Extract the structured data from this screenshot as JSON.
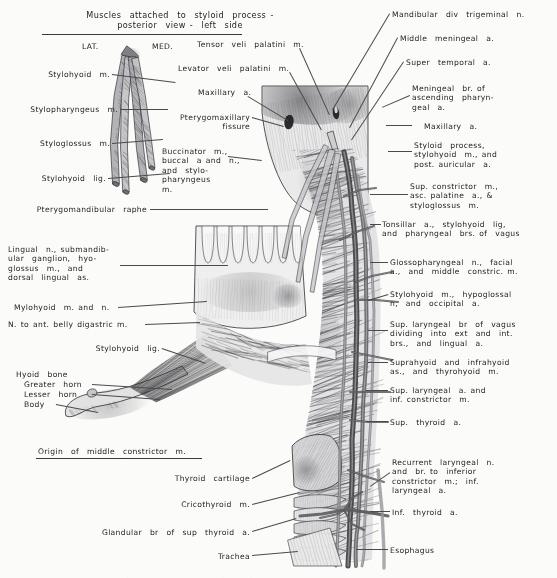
{
  "plate": {
    "title": "Muscles attached to styloid process - posterior view - left side",
    "background_color": "#fbfbf9",
    "ink_color": "#1d1d1d",
    "width": 557,
    "height": 578
  },
  "inset_title": {
    "line1": "Muscles  attached  to  styloid  process -",
    "line2": "posterior  view -  left  side"
  },
  "orientation": {
    "lateral": "LAT.",
    "medial": "MED."
  },
  "inset_caption": {
    "origin_middle_constrictor": "Origin  of  middle  constrictor  m."
  },
  "labels_left": [
    {
      "name": "stylohyoid-m",
      "lines": [
        "Stylohyoid  m."
      ]
    },
    {
      "name": "stylopharyngeus-m",
      "lines": [
        "Stylopharyngeus  m."
      ]
    },
    {
      "name": "styloglossus-m",
      "lines": [
        "Styloglossus  m."
      ]
    },
    {
      "name": "stylohyoid-lig",
      "lines": [
        "Stylohyoid  lig."
      ]
    },
    {
      "name": "pterygomandibular-raphe",
      "lines": [
        "Pterygomandibular  raphe"
      ]
    },
    {
      "name": "lingual-n-block",
      "lines": [
        "Lingual  n., submandib-",
        "ular  ganglion,  hyo-",
        "glossus  m.,  and",
        "dorsal  lingual  as."
      ]
    },
    {
      "name": "mylohyoid-m-and-n",
      "lines": [
        "Mylohyoid  m. and  n."
      ]
    },
    {
      "name": "n-to-ant-belly-digastric",
      "lines": [
        "N. to ant. belly digastric m."
      ]
    },
    {
      "name": "stylohyoid-lig-2",
      "lines": [
        "Stylohyoid  lig."
      ]
    },
    {
      "name": "hyoid-bone",
      "lines": [
        "Hyoid  bone"
      ]
    },
    {
      "name": "hyoid-greater-horn",
      "lines": [
        "Greater  horn"
      ]
    },
    {
      "name": "hyoid-lesser-horn",
      "lines": [
        "Lesser  horn"
      ]
    },
    {
      "name": "hyoid-body",
      "lines": [
        "Body"
      ]
    }
  ],
  "labels_upper_mid": [
    {
      "name": "tensor-veli-palatini-m",
      "lines": [
        "Tensor  veli  palatini  m."
      ]
    },
    {
      "name": "levator-veli-palatini-m",
      "lines": [
        "Levator  veli  palatini  m."
      ]
    },
    {
      "name": "maxillary-a-left",
      "lines": [
        "Maxillary  a."
      ]
    },
    {
      "name": "pterygomaxillary-fissure",
      "lines": [
        "Pterygomaxillary",
        "fissure"
      ]
    },
    {
      "name": "buccinator-block",
      "lines": [
        "Buccinator  m.,",
        "buccal  a and  n.,",
        "and  stylo-",
        "pharyngeus",
        "m."
      ]
    }
  ],
  "labels_bottom_mid": [
    {
      "name": "thyroid-cartilage",
      "lines": [
        "Thyroid  cartilage"
      ]
    },
    {
      "name": "cricothyroid-m",
      "lines": [
        "Cricothyroid  m."
      ]
    },
    {
      "name": "glandular-br-sup-thyroid-a",
      "lines": [
        "Glandular  br  of  sup  thyroid  a."
      ]
    },
    {
      "name": "trachea",
      "lines": [
        "Trachea"
      ]
    }
  ],
  "labels_right": [
    {
      "name": "mandibular-div-trigeminal-n",
      "lines": [
        "Mandibular  div  trigeminal  n."
      ]
    },
    {
      "name": "middle-meningeal-a",
      "lines": [
        "Middle  meningeal  a."
      ]
    },
    {
      "name": "super-temporal-a",
      "lines": [
        "Super  temporal  a."
      ]
    },
    {
      "name": "meningeal-br-asc-pharyngeal",
      "lines": [
        "Meningeal  br. of",
        "ascending  pharyn-",
        "geal  a."
      ]
    },
    {
      "name": "maxillary-a-right",
      "lines": [
        "Maxillary  a."
      ]
    },
    {
      "name": "styloid-process-block",
      "lines": [
        "Styloid  process,",
        "stylohyoid  m., and",
        "post. auricular  a."
      ]
    },
    {
      "name": "sup-constrictor-block",
      "lines": [
        "Sup. constrictor  m.,",
        "asc. palatine  a., &",
        "styloglossus  m."
      ]
    },
    {
      "name": "tonsillar-a-block",
      "lines": [
        "Tonsillar  a.,  stylohyoid  lig,",
        "and  pharyngeal  brs. of  vagus"
      ]
    },
    {
      "name": "glossopharyngeal-n-block",
      "lines": [
        "Glossopharyngeal  n.,  facial",
        "a.,  and  middle  constric. m."
      ]
    },
    {
      "name": "stylohyoid-m-hypoglossal-block",
      "lines": [
        "Stylohyoid  m.,  hypoglossal",
        "n,  and  occipital  a."
      ]
    },
    {
      "name": "sup-laryngeal-br-vagus-block",
      "lines": [
        "Sup. laryngeal  br  of  vagus",
        "dividing  into  ext  and  int.",
        "brs.,  and  lingual  a."
      ]
    },
    {
      "name": "suprahyoid-infrahyoid-block",
      "lines": [
        "Suprahyoid  and  infrahyoid",
        "as.,  and  thyrohyoid  m."
      ]
    },
    {
      "name": "sup-laryngeal-a-block",
      "lines": [
        "Sup. laryngeal  a. and",
        "inf. constrictor  m."
      ]
    },
    {
      "name": "sup-thyroid-a",
      "lines": [
        "Sup.  thyroid  a."
      ]
    },
    {
      "name": "recurrent-laryngeal-n-block",
      "lines": [
        "Recurrent  laryngeal  n.",
        "and  br. to  inferior",
        "constrictor  m.;  inf.",
        "laryngeal  a."
      ]
    },
    {
      "name": "inf-thyroid-a",
      "lines": [
        "Inf.  thyroid  a."
      ]
    },
    {
      "name": "esophagus",
      "lines": [
        "Esophagus"
      ]
    }
  ]
}
